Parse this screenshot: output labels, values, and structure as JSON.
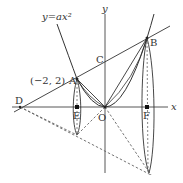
{
  "figure": {
    "type": "coordinate-geometry",
    "curve_label": "y=ax²",
    "axes": {
      "x_label": "x",
      "y_label": "y",
      "origin_label": "O"
    },
    "points": {
      "A": {
        "label": "A",
        "coord_label": "(−2,  2)"
      },
      "B": {
        "label": "B"
      },
      "C": {
        "label": "C"
      },
      "D": {
        "label": "D"
      },
      "E": {
        "label": "E"
      },
      "F": {
        "label": "F"
      }
    },
    "colors": {
      "line": "#333333",
      "dashed": "#666666",
      "background": "#ffffff"
    }
  }
}
